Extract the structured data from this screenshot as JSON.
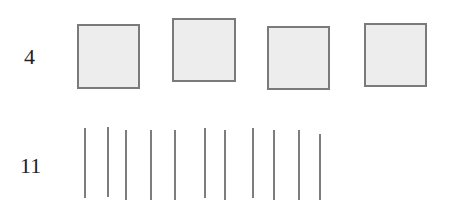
{
  "rows": [
    {
      "label": "4",
      "shape": "square",
      "count": 4,
      "items": [
        {
          "x": 77,
          "y": 24,
          "w": 63,
          "h": 65
        },
        {
          "x": 172,
          "y": 18,
          "w": 64,
          "h": 64
        },
        {
          "x": 267,
          "y": 26,
          "w": 63,
          "h": 64
        },
        {
          "x": 364,
          "y": 23,
          "w": 63,
          "h": 64
        }
      ]
    },
    {
      "label": "11",
      "shape": "vertical-line",
      "count": 11,
      "items": [
        {
          "x": 84,
          "y": 128,
          "h": 70
        },
        {
          "x": 107,
          "y": 127,
          "h": 70
        },
        {
          "x": 125,
          "y": 130,
          "h": 70
        },
        {
          "x": 150,
          "y": 130,
          "h": 70
        },
        {
          "x": 174,
          "y": 130,
          "h": 70
        },
        {
          "x": 204,
          "y": 128,
          "h": 70
        },
        {
          "x": 224,
          "y": 130,
          "h": 70
        },
        {
          "x": 252,
          "y": 128,
          "h": 70
        },
        {
          "x": 273,
          "y": 130,
          "h": 70
        },
        {
          "x": 298,
          "y": 130,
          "h": 70
        },
        {
          "x": 319,
          "y": 134,
          "h": 66
        }
      ]
    }
  ],
  "colors": {
    "stroke": "#7a7a7a",
    "fill": "#ededed",
    "text": "#222222"
  }
}
